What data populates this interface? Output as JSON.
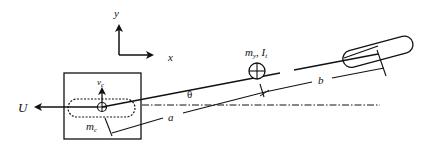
{
  "diagram": {
    "axes": {
      "x_label": "x",
      "y_label": "y"
    },
    "labels": {
      "force": "U",
      "velocity": "v",
      "velocity_sub": "c",
      "cart_mass": "m",
      "cart_mass_sub": "c",
      "link_mass": "m",
      "link_mass_sub": "y",
      "link_inertia": "I",
      "link_inertia_sub": "t",
      "angle": "θ",
      "dim_a": "a",
      "dim_b": "b"
    },
    "colors": {
      "stroke": "#111111",
      "background": "#ffffff"
    }
  }
}
